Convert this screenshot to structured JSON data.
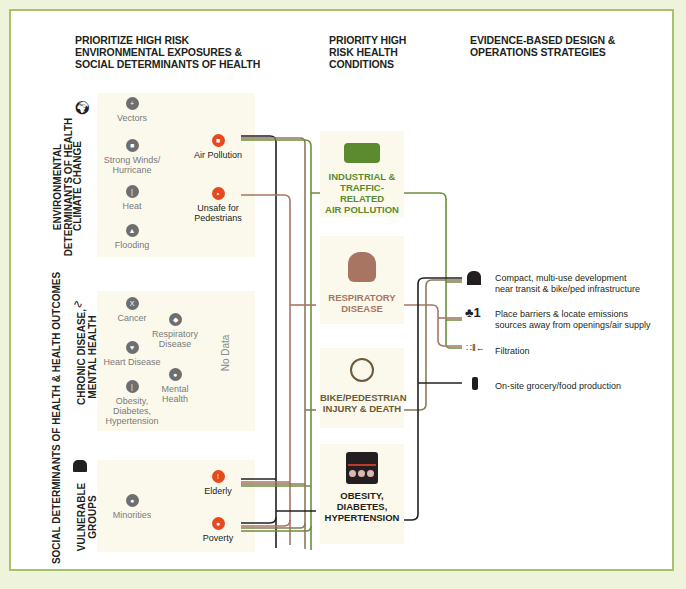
{
  "headers": {
    "col1": "PRIORITIZE HIGH RISK ENVIRONMENTAL EXPOSURES & SOCIAL DETERMINANTS OF HEALTH",
    "col1_lines": [
      "PRIORITIZE HIGH RISK",
      "ENVIRONMENTAL EXPOSURES &",
      "SOCIAL DETERMINANTS OF HEALTH"
    ],
    "col2_lines": [
      "PRIORITY HIGH",
      "RISK HEALTH",
      "CONDITIONS"
    ],
    "col3_lines": [
      "EVIDENCE-BASED DESIGN &",
      "OPERATIONS STRATEGIES"
    ]
  },
  "outer_labels": {
    "environmental": [
      "ENVIRONMENTAL",
      "DETERMINANTS OF HEALTH"
    ],
    "social": "SOCIAL DETERMINANTS OF HEALTH & HEALTH OUTCOMES"
  },
  "groups": [
    {
      "id": "climate-change",
      "label": "CLIMATE CHANGE",
      "icon": "globe-icon",
      "low_priority": [
        {
          "label": "Vectors",
          "icon": "mosquito-icon"
        },
        {
          "label": "Strong Winds/ Hurricane",
          "icon": "building-wind-icon"
        },
        {
          "label": "Heat",
          "icon": "thermometer-icon"
        },
        {
          "label": "Flooding",
          "icon": "flood-icon"
        }
      ],
      "high_priority": [
        {
          "label": "Air Pollution",
          "icon": "truck-icon"
        },
        {
          "label": "Unsafe for Pedestrians",
          "icon": "pedestrian-icon"
        }
      ]
    },
    {
      "id": "chronic-disease",
      "label": "CHRONIC DISEASE, MENTAL HEALTH",
      "label_lines": [
        "CHRONIC DISEASE,",
        "MENTAL HEALTH"
      ],
      "icon": "heartbeat-icon",
      "low_priority": [
        {
          "label": "Cancer",
          "icon": "ribbon-icon"
        },
        {
          "label": "Respiratory Disease",
          "icon": "lungs-icon"
        },
        {
          "label": "Heart Disease",
          "icon": "heart-icon"
        },
        {
          "label": "Mental Health",
          "icon": "brain-icon"
        },
        {
          "label": "Obesity, Diabetes, Hypertension",
          "icon": "thermometer-icon"
        }
      ],
      "no_data": "No Data"
    },
    {
      "id": "vulnerable-groups",
      "label": "VULNERABLE GROUPS",
      "label_lines": [
        "VULNERABLE",
        "GROUPS"
      ],
      "icon": "people-group-icon",
      "low_priority": [
        {
          "label": "Minorities",
          "icon": "faces-icon"
        }
      ],
      "high_priority": [
        {
          "label": "Elderly",
          "icon": "cane-icon"
        },
        {
          "label": "Poverty",
          "icon": "piggy-bank-icon"
        }
      ]
    }
  ],
  "conditions": [
    {
      "label_lines": [
        "INDUSTRIAL &",
        "TRAFFIC-RELATED",
        "AIR POLLUTION"
      ],
      "color": "#5b8a2f",
      "icon": "factory-truck-icon"
    },
    {
      "label_lines": [
        "RESPIRATORY",
        "DISEASE"
      ],
      "color": "#a87562",
      "icon": "lungs-icon"
    },
    {
      "label_lines": [
        "BIKE/PEDESTRIAN",
        "INJURY & DEATH"
      ],
      "color": "#6b5a3a",
      "icon": "bike-crash-icon"
    },
    {
      "label_lines": [
        "OBESITY,",
        "DIABETES,",
        "HYPERTENSION"
      ],
      "color": "#231f20",
      "icon": "scale-icon"
    }
  ],
  "strategies": [
    {
      "label_lines": [
        "Compact, multi-use development",
        "near transit & bike/ped infrastructure"
      ],
      "icon": "buildings-icon"
    },
    {
      "label_lines": [
        "Place barriers & locate emissions",
        "sources away from openings/air supply"
      ],
      "icon": "tree-barrier-icon"
    },
    {
      "label_lines": [
        "Filtration"
      ],
      "icon": "filter-icon"
    },
    {
      "label_lines": [
        "On-site grocery/food production"
      ],
      "icon": "plant-icon"
    }
  ],
  "colors": {
    "frame": "#a7c26a",
    "highlight": "#e8491d",
    "grey_icon": "#6d6e70",
    "panel": "#fbf9ec",
    "line_green": "#6b8f3a",
    "line_rose": "#a87562",
    "line_tan": "#8a7a5a",
    "line_black": "#231f20"
  }
}
